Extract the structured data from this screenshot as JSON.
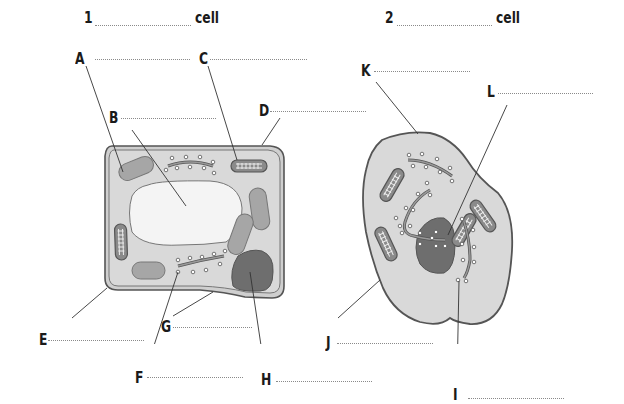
{
  "diagram": {
    "title_1": {
      "number": "1",
      "suffix": "cell"
    },
    "title_2": {
      "number": "2",
      "suffix": "cell"
    },
    "plant_cell_labels": [
      "A",
      "B",
      "C",
      "D",
      "E",
      "F",
      "G",
      "H"
    ],
    "animal_cell_labels": [
      "I",
      "J",
      "K",
      "L"
    ],
    "labels": {
      "A": "A",
      "B": "B",
      "C": "C",
      "D": "D",
      "E": "E",
      "F": "F",
      "G": "G",
      "H": "H",
      "I": "I",
      "J": "J",
      "K": "K",
      "L": "L"
    },
    "answer_blanks": {
      "title_1": "",
      "title_2": "",
      "A": "",
      "B": "",
      "C": "",
      "D": "",
      "E": "",
      "F": "",
      "G": "",
      "H": "",
      "I": "",
      "J": "",
      "K": "",
      "L": ""
    },
    "colors": {
      "cytoplasm": "#d9d9d9",
      "outline": "#555555",
      "vacuole": "#f4f4f4",
      "chloroplast": "#a6a6a6",
      "nucleus": "#6e6e6e",
      "text": "#1a1a1a",
      "leader_line": "#333333",
      "blank_line": "#8a8a8a"
    }
  }
}
